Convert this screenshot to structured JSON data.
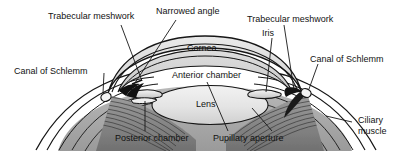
{
  "figure": {
    "background_color": "#ffffff",
    "ink_color": "#121212"
  },
  "labels": {
    "trabecular_meshwork_left": "Trabecular meshwork",
    "narrowed_angle": "Narrowed angle",
    "trabecular_meshwork_right": "Trabecular meshwork",
    "iris": "Iris",
    "canal_of_schlemm_left": "Canal of Schlemm",
    "canal_of_schlemm_right": "Canal of Schlemm",
    "cornea": "Cornea",
    "anterior_chamber": "Anterior chamber",
    "lens": "Lens",
    "posterior_chamber": "Posterior chamber",
    "pupillary_aperture": "Pupillary aperture",
    "ciliary_muscle_line1": "Ciliary",
    "ciliary_muscle_line2": "muscle"
  },
  "structures": [
    {
      "name": "cornea",
      "kind": "dome-outline"
    },
    {
      "name": "anterior-chamber",
      "kind": "space"
    },
    {
      "name": "lens",
      "kind": "ellipse"
    },
    {
      "name": "iris",
      "kind": "flap"
    },
    {
      "name": "canal-of-schlemm",
      "kind": "small-oval"
    },
    {
      "name": "trabecular-meshwork",
      "kind": "wedge"
    },
    {
      "name": "ciliary-muscle",
      "kind": "striated-band"
    },
    {
      "name": "sclera",
      "kind": "layered-arcs"
    },
    {
      "name": "posterior-chamber",
      "kind": "space"
    },
    {
      "name": "pupillary-aperture",
      "kind": "opening"
    }
  ]
}
